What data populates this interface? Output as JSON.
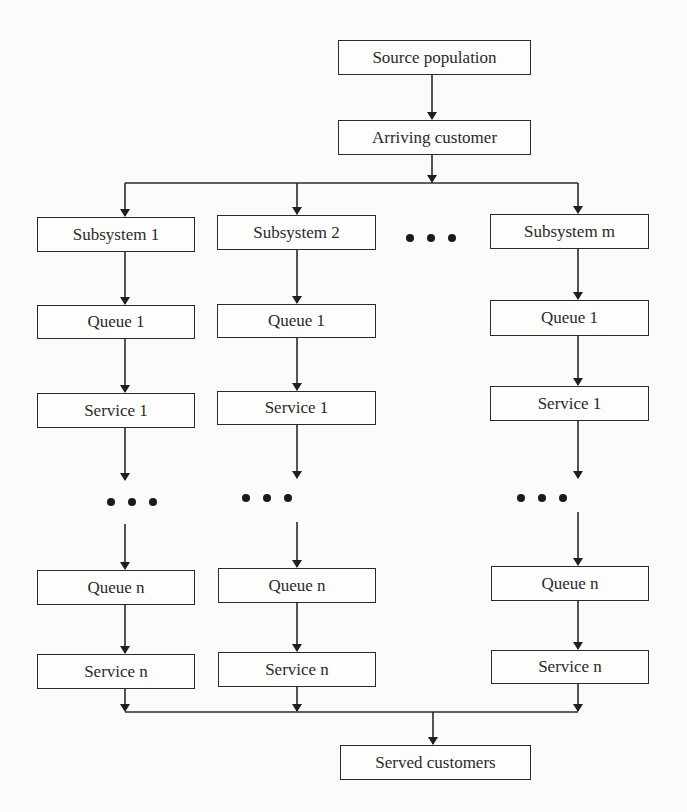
{
  "diagram": {
    "type": "flowchart",
    "title": "",
    "colors": {
      "line": "#2a2a2a",
      "background": "#fbfbf9"
    },
    "top": {
      "source": "Source population",
      "arrival": "Arriving customer"
    },
    "subsystems": [
      {
        "label": "Subsystem 1",
        "queue_first": "Queue 1",
        "service_first": "Service 1",
        "queue_last": "Queue n",
        "service_last": "Service n"
      },
      {
        "label": "Subsystem 2",
        "queue_first": "Queue 1",
        "service_first": "Service 1",
        "queue_last": "Queue n",
        "service_last": "Service n"
      },
      {
        "label": "Subsystem m",
        "queue_first": "Queue 1",
        "service_first": "Service 1",
        "queue_last": "Queue n",
        "service_last": "Service n"
      }
    ],
    "ellipsis_between_subsystems": "• • •",
    "ellipsis_between_stages": "• • •",
    "output": "Served customers",
    "edges": [
      [
        "Source population",
        "Arriving customer"
      ],
      [
        "Arriving customer",
        "Subsystem 1"
      ],
      [
        "Arriving customer",
        "Subsystem 2"
      ],
      [
        "Arriving customer",
        "Subsystem m"
      ],
      [
        "Subsystem",
        "Queue 1"
      ],
      [
        "Queue 1",
        "Service 1"
      ],
      [
        "Service 1",
        "..."
      ],
      [
        "...",
        "Queue n"
      ],
      [
        "Queue n",
        "Service n"
      ],
      [
        "Service n",
        "Served customers"
      ]
    ]
  }
}
